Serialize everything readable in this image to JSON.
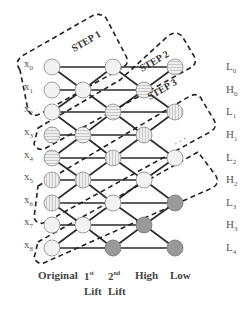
{
  "diagram": {
    "steps": [
      {
        "label": "STEP 1"
      },
      {
        "label": "STEP 2"
      },
      {
        "label": "STEP 3"
      }
    ],
    "ellipsis": "· · ·",
    "inputs": [
      {
        "base": "x",
        "sub": "0"
      },
      {
        "base": "x",
        "sub": "1"
      },
      {
        "base": "x",
        "sub": "2"
      },
      {
        "base": "x",
        "sub": "3"
      },
      {
        "base": "x",
        "sub": "4"
      },
      {
        "base": "x",
        "sub": "5"
      },
      {
        "base": "x",
        "sub": "6"
      },
      {
        "base": "x",
        "sub": "7"
      },
      {
        "base": "x",
        "sub": "8"
      }
    ],
    "outputs": [
      {
        "base": "L",
        "sub": "0"
      },
      {
        "base": "H",
        "sub": "0"
      },
      {
        "base": "L",
        "sub": "1"
      },
      {
        "base": "H",
        "sub": "1"
      },
      {
        "base": "L",
        "sub": "2"
      },
      {
        "base": "H",
        "sub": "2"
      },
      {
        "base": "L",
        "sub": "3"
      },
      {
        "base": "H",
        "sub": "3"
      },
      {
        "base": "L",
        "sub": "4"
      }
    ],
    "columns": [
      {
        "line1": "Original",
        "line2": ""
      },
      {
        "line1": "1",
        "sup": "st",
        "line2": "Lift"
      },
      {
        "line1": "2",
        "sup": "nd",
        "line2": "Lift"
      },
      {
        "line1": "High",
        "line2": ""
      },
      {
        "line1": "Low",
        "line2": ""
      }
    ],
    "node_fills": {
      "plain": "#f2f2f2",
      "hatch_h": "#e4e4e4",
      "hatch_v": "#e8e8e8",
      "dark": "#999999"
    },
    "node_styles": {
      "original": [
        "plain",
        "plain",
        "plain",
        "hatch_h",
        "hatch_h",
        "hatch_v",
        "hatch_v",
        "plain",
        "plain"
      ],
      "lift1": {
        "1": "plain",
        "3": "hatch_h",
        "5": "hatch_v",
        "7": "plain"
      },
      "lift2": {
        "0": "plain",
        "2": "hatch_h",
        "4": "hatch_v",
        "6": "plain",
        "8": "dark"
      },
      "high": {
        "1": "hatch_h",
        "3": "hatch_v",
        "5": "plain",
        "7": "dark"
      },
      "low": {
        "0": "hatch_h",
        "2": "hatch_v",
        "4": "plain",
        "6": "dark",
        "8": "dark"
      }
    }
  }
}
